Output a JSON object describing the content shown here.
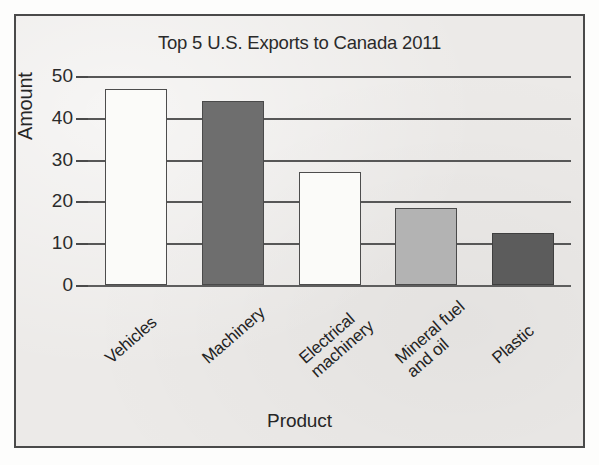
{
  "figure": {
    "background_color": "#eceae8",
    "frame_color": "#4a4a4a"
  },
  "chart_data": {
    "type": "bar",
    "title": "Top 5 U.S. Exports to Canada 2011",
    "xlabel": "Product",
    "ylabel": "Amount",
    "categories": [
      "Vehicles",
      "Machinery",
      "Electrical machinery",
      "Mineral fuel and oil",
      "Plastic"
    ],
    "values": [
      47,
      44,
      27,
      18.5,
      12.5
    ],
    "ylim": [
      0,
      50
    ],
    "yticks": [
      0,
      10,
      20,
      30,
      40,
      50
    ],
    "ytick_labels": [
      "0",
      "10",
      "20",
      "30",
      "40",
      "50"
    ],
    "grid": "horizontal",
    "legend": "none",
    "bars": [
      {
        "category": "Vehicles",
        "label_line1": "Vehicles",
        "label_line2": "",
        "value": 47,
        "fill": "#fbfbf9",
        "edge": "#4d4d4d"
      },
      {
        "category": "Machinery",
        "label_line1": "Machinery",
        "label_line2": "",
        "value": 44,
        "fill": "#6e6e6e",
        "edge": "#4a4a4a"
      },
      {
        "category": "Electrical machinery",
        "label_line1": "Electrical",
        "label_line2": "machinery",
        "value": 27,
        "fill": "#fbfbf9",
        "edge": "#4d4d4d"
      },
      {
        "category": "Mineral fuel and oil",
        "label_line1": "Mineral fuel",
        "label_line2": "and oil",
        "value": 18.5,
        "fill": "#b3b3b3",
        "edge": "#4a4a4a"
      },
      {
        "category": "Plastic",
        "label_line1": "Plastic",
        "label_line2": "",
        "value": 12.5,
        "fill": "#5c5c5c",
        "edge": "#3f3f3f"
      }
    ]
  }
}
